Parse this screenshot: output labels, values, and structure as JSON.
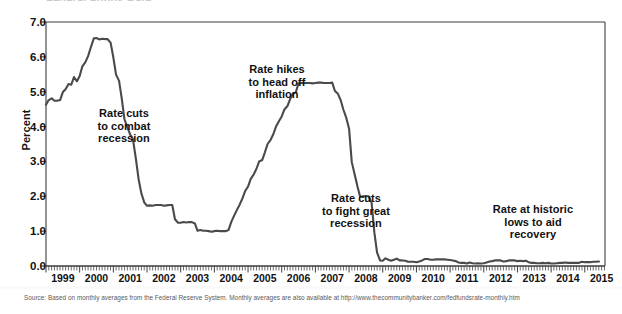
{
  "figure": {
    "title_remnant": "Federal Funds Rate",
    "source_note": "Source: Based on monthly averages from the Federal Reserve System. Monthly averages are also available at http://www.thecommunitybanker.com/fedfundsrate-monthly.htm",
    "line_color": "#4a4a4a",
    "axis_color": "#3c3c3c",
    "text_color": "#111111"
  },
  "chart_data": {
    "type": "line",
    "title": "",
    "xlabel": "",
    "ylabel": "Percent",
    "ylim": [
      0.0,
      7.0
    ],
    "xlim": [
      1999.0,
      2015.6
    ],
    "grid": false,
    "legend": "none",
    "ytick_labels": [
      "0.0",
      "1.0",
      "2.0",
      "3.0",
      "4.0",
      "5.0",
      "6.0",
      "7.0"
    ],
    "ytick_values": [
      0.0,
      1.0,
      2.0,
      3.0,
      4.0,
      5.0,
      6.0,
      7.0
    ],
    "xtick_labels": [
      "1999",
      "2000",
      "2001",
      "2002",
      "2003",
      "2004",
      "2005",
      "2006",
      "2007",
      "2008",
      "2009",
      "2010",
      "2011",
      "2012",
      "2013",
      "2014",
      "2015"
    ],
    "xtick_values": [
      1999,
      2000,
      2001,
      2002,
      2003,
      2004,
      2005,
      2006,
      2007,
      2008,
      2009,
      2010,
      2011,
      2012,
      2013,
      2014,
      2015
    ],
    "minor_xticks": "monthly",
    "series": [
      {
        "name": "Federal funds rate",
        "x": [
          1999.0,
          1999.08,
          1999.17,
          1999.25,
          1999.33,
          1999.42,
          1999.5,
          1999.58,
          1999.67,
          1999.75,
          1999.83,
          1999.92,
          2000.0,
          2000.08,
          2000.17,
          2000.25,
          2000.33,
          2000.42,
          2000.5,
          2000.58,
          2000.67,
          2000.75,
          2000.83,
          2000.92,
          2001.0,
          2001.08,
          2001.17,
          2001.25,
          2001.33,
          2001.42,
          2001.5,
          2001.58,
          2001.67,
          2001.75,
          2001.83,
          2001.92,
          2002.0,
          2002.08,
          2002.17,
          2002.25,
          2002.33,
          2002.42,
          2002.5,
          2002.58,
          2002.67,
          2002.75,
          2002.83,
          2002.92,
          2003.0,
          2003.08,
          2003.17,
          2003.25,
          2003.33,
          2003.42,
          2003.5,
          2003.58,
          2003.67,
          2003.75,
          2003.83,
          2003.92,
          2004.0,
          2004.08,
          2004.17,
          2004.25,
          2004.33,
          2004.42,
          2004.5,
          2004.58,
          2004.67,
          2004.75,
          2004.83,
          2004.92,
          2005.0,
          2005.08,
          2005.17,
          2005.25,
          2005.33,
          2005.42,
          2005.5,
          2005.58,
          2005.67,
          2005.75,
          2005.83,
          2005.92,
          2006.0,
          2006.08,
          2006.17,
          2006.25,
          2006.33,
          2006.42,
          2006.5,
          2006.58,
          2006.67,
          2006.75,
          2006.83,
          2006.92,
          2007.0,
          2007.08,
          2007.17,
          2007.25,
          2007.33,
          2007.42,
          2007.5,
          2007.58,
          2007.67,
          2007.75,
          2007.83,
          2007.92,
          2008.0,
          2008.08,
          2008.17,
          2008.25,
          2008.33,
          2008.42,
          2008.5,
          2008.58,
          2008.67,
          2008.75,
          2008.83,
          2008.92,
          2009.0,
          2009.08,
          2009.17,
          2009.25,
          2009.33,
          2009.42,
          2009.5,
          2009.58,
          2009.67,
          2009.75,
          2009.83,
          2009.92,
          2010.0,
          2010.08,
          2010.17,
          2010.25,
          2010.33,
          2010.42,
          2010.5,
          2010.58,
          2010.67,
          2010.75,
          2010.83,
          2010.92,
          2011.0,
          2011.08,
          2011.17,
          2011.25,
          2011.33,
          2011.42,
          2011.5,
          2011.58,
          2011.67,
          2011.75,
          2011.83,
          2011.92,
          2012.0,
          2012.08,
          2012.17,
          2012.25,
          2012.33,
          2012.42,
          2012.5,
          2012.58,
          2012.67,
          2012.75,
          2012.83,
          2012.92,
          2013.0,
          2013.08,
          2013.17,
          2013.25,
          2013.33,
          2013.42,
          2013.5,
          2013.58,
          2013.67,
          2013.75,
          2013.83,
          2013.92,
          2014.0,
          2014.08,
          2014.17,
          2014.25,
          2014.33,
          2014.42,
          2014.5,
          2014.58,
          2014.67,
          2014.75,
          2014.83,
          2014.92,
          2015.0,
          2015.08,
          2015.17,
          2015.25,
          2015.33,
          2015.42
        ],
        "y": [
          4.63,
          4.76,
          4.81,
          4.74,
          4.74,
          4.76,
          4.99,
          5.07,
          5.22,
          5.2,
          5.42,
          5.3,
          5.45,
          5.73,
          5.85,
          6.02,
          6.27,
          6.53,
          6.54,
          6.5,
          6.52,
          6.51,
          6.51,
          6.4,
          5.98,
          5.49,
          5.31,
          4.8,
          4.21,
          3.97,
          3.77,
          3.65,
          3.07,
          2.49,
          2.09,
          1.82,
          1.73,
          1.74,
          1.73,
          1.75,
          1.75,
          1.75,
          1.73,
          1.74,
          1.75,
          1.75,
          1.34,
          1.24,
          1.24,
          1.26,
          1.25,
          1.26,
          1.26,
          1.22,
          1.01,
          1.03,
          1.01,
          1.01,
          1.0,
          0.98,
          1.0,
          1.01,
          1.0,
          1.0,
          1.0,
          1.03,
          1.26,
          1.43,
          1.61,
          1.76,
          1.93,
          2.16,
          2.28,
          2.5,
          2.63,
          2.79,
          3.0,
          3.04,
          3.26,
          3.5,
          3.62,
          3.78,
          4.0,
          4.16,
          4.29,
          4.49,
          4.59,
          4.79,
          4.94,
          4.99,
          5.24,
          5.25,
          5.25,
          5.25,
          5.25,
          5.24,
          5.25,
          5.26,
          5.26,
          5.25,
          5.25,
          5.25,
          5.26,
          5.02,
          4.94,
          4.76,
          4.49,
          4.24,
          3.94,
          2.98,
          2.61,
          2.28,
          1.98,
          2.0,
          2.01,
          2.0,
          1.81,
          0.97,
          0.39,
          0.16,
          0.15,
          0.22,
          0.18,
          0.15,
          0.18,
          0.21,
          0.16,
          0.16,
          0.15,
          0.12,
          0.12,
          0.12,
          0.11,
          0.13,
          0.16,
          0.2,
          0.2,
          0.18,
          0.18,
          0.19,
          0.19,
          0.19,
          0.19,
          0.18,
          0.17,
          0.16,
          0.14,
          0.1,
          0.09,
          0.09,
          0.07,
          0.1,
          0.08,
          0.07,
          0.08,
          0.07,
          0.08,
          0.1,
          0.13,
          0.14,
          0.16,
          0.16,
          0.16,
          0.13,
          0.14,
          0.16,
          0.16,
          0.16,
          0.14,
          0.15,
          0.14,
          0.15,
          0.11,
          0.09,
          0.09,
          0.08,
          0.08,
          0.09,
          0.08,
          0.09,
          0.07,
          0.07,
          0.08,
          0.09,
          0.09,
          0.1,
          0.09,
          0.09,
          0.09,
          0.09,
          0.09,
          0.12,
          0.11,
          0.11,
          0.11,
          0.12,
          0.12,
          0.13
        ]
      }
    ],
    "annotations": [
      {
        "id": "anno-0",
        "text": "Rate cuts\nto combat\nrecession",
        "x": 2000.9,
        "y": 3.5
      },
      {
        "id": "anno-1",
        "text": "Rate hikes\nto head off\ninflation",
        "x": 2005.5,
        "y": 5.6
      },
      {
        "id": "anno-2",
        "text": "Rate cuts\nto fight great\nrecession",
        "x": 2007.8,
        "y": 1.8
      },
      {
        "id": "anno-3",
        "text": "Rate at historic\nlows to aid\nrecovery",
        "x": 2012.7,
        "y": 1.5
      }
    ]
  }
}
